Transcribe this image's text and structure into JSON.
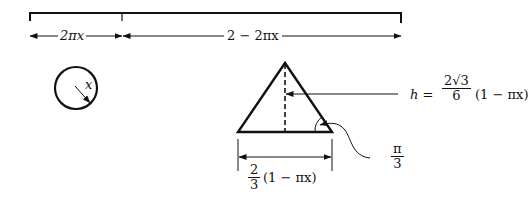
{
  "diagram": {
    "type": "geometry-wire-cut",
    "stroke_color": "#111111",
    "background": "#ffffff",
    "segment_labels": {
      "left_piece": "2πx",
      "right_piece": "2 − 2πx"
    },
    "circle": {
      "radius_label": "x"
    },
    "triangle": {
      "height_label_lhs": "h =",
      "height_fraction_num": "2√3",
      "height_fraction_den": "6",
      "height_factor": "(1 − πx)",
      "base_fraction_num": "2",
      "base_fraction_den": "3",
      "base_factor": "(1 − πx)",
      "angle_num": "π",
      "angle_den": "3"
    }
  }
}
